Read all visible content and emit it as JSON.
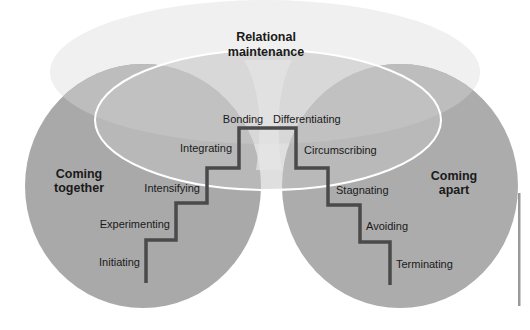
{
  "diagram": {
    "type": "relationship-stages-staircase",
    "colors": {
      "background": "#ffffff",
      "circle_fill": "#a9a9a9",
      "top_ellipse_fill": "#f0f0f0",
      "inner_overlap_fill": "#c2c2c2",
      "inner_outline": "#ffffff",
      "staircase_stroke": "#4a4a4a",
      "side_bar": "#9a9a9a",
      "text": "#1a1a1a"
    },
    "zones": {
      "top": {
        "line1": "Relational",
        "line2": "maintenance"
      },
      "left": {
        "line1": "Coming",
        "line2": "together"
      },
      "right": {
        "line1": "Coming",
        "line2": "apart"
      }
    },
    "stages_coming_together": [
      {
        "label": "Initiating"
      },
      {
        "label": "Experimenting"
      },
      {
        "label": "Intensifying"
      },
      {
        "label": "Integrating"
      },
      {
        "label": "Bonding"
      }
    ],
    "stages_coming_apart": [
      {
        "label": "Differentiating"
      },
      {
        "label": "Circumscribing"
      },
      {
        "label": "Stagnating"
      },
      {
        "label": "Avoiding"
      },
      {
        "label": "Terminating"
      }
    ]
  }
}
